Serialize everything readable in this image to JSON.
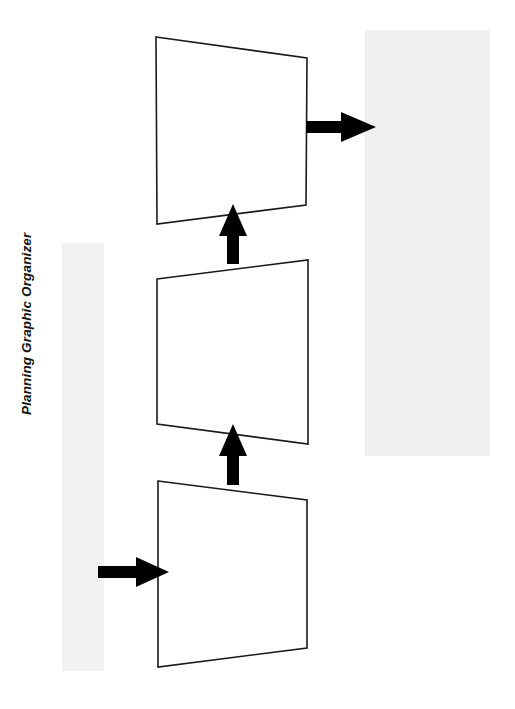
{
  "document": {
    "title": "Planning Graphic Organizer",
    "page_background": "#ffffff",
    "ink_color": "#1a1a1a"
  },
  "ghost_blocks": [
    {
      "name": "left-margin-bleed",
      "color": "#f2f2f2",
      "text": ""
    },
    {
      "name": "right-page-bleed",
      "color": "#efefef",
      "text": ""
    }
  ],
  "diagram": {
    "name": "planning-graphic-organizer-flowchart",
    "type": "flow",
    "direction": "bottom-to-top",
    "boxes": [
      {
        "id": "box-top",
        "label": "",
        "order": 3,
        "points": "156,37 307,58 306,205 157,224"
      },
      {
        "id": "box-middle",
        "label": "",
        "order": 2,
        "points": "157,279 308,260 308,444 157,424"
      },
      {
        "id": "box-bottom",
        "label": "",
        "order": 1,
        "points": "158,481 307,500 307,648 158,667"
      }
    ],
    "arrows": [
      {
        "id": "arrow-input",
        "direction": "right",
        "from": "left-margin",
        "to": "box-bottom",
        "points": "98,566 136,566 136,557 169,572 136,587 136,578 98,578"
      },
      {
        "id": "arrow-bottom-to-middle",
        "direction": "up",
        "from": "box-bottom",
        "to": "box-middle",
        "points": "233,424 247,456 239,456 239,485 227,485 227,456 219,456"
      },
      {
        "id": "arrow-middle-to-top",
        "direction": "up",
        "from": "box-middle",
        "to": "box-top",
        "points": "233,204 247,236 239,236 239,264 227,264 227,236 219,236"
      },
      {
        "id": "arrow-output",
        "direction": "right",
        "from": "box-top",
        "to": "right-page",
        "points": "306,121 341,121 341,112 376,127 341,142 341,133 306,133"
      }
    ]
  }
}
